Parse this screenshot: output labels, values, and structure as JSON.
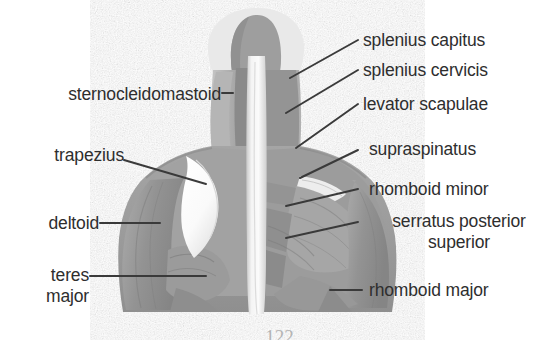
{
  "figure": {
    "type": "anatomical-illustration",
    "style": "grayscale halftone line drawing",
    "background_color": "#ffffff",
    "ink_color": "#2e2e2e",
    "muscle_fill": "#9a9a9a",
    "muscle_fill_light": "#b9b9b9",
    "muscle_fill_dark": "#7d7d7d",
    "midline_color": "#f2f2f2",
    "cutaway_color": "#fdfdfd"
  },
  "labels": {
    "left": [
      {
        "id": "sternocleidomastoid",
        "text": "sternocleidomastoid"
      },
      {
        "id": "trapezius",
        "text": "trapezius"
      },
      {
        "id": "deltoid",
        "text": "deltoid"
      },
      {
        "id": "teres-major",
        "line1": "teres",
        "line2": "major"
      }
    ],
    "right": [
      {
        "id": "splenius-capitus",
        "text": "splenius capitus"
      },
      {
        "id": "splenius-cervicis",
        "text": "splenius cervicis"
      },
      {
        "id": "levator-scapulae",
        "text": "levator scapulae"
      },
      {
        "id": "supraspinatus",
        "text": "supraspinatus"
      },
      {
        "id": "rhomboid-minor",
        "text": "rhomboid minor"
      },
      {
        "id": "serratus-posterior-superior",
        "line1": "serratus posterior",
        "line2": "superior"
      },
      {
        "id": "rhomboid-major",
        "text": "rhomboid major"
      }
    ]
  },
  "page_number": "122"
}
